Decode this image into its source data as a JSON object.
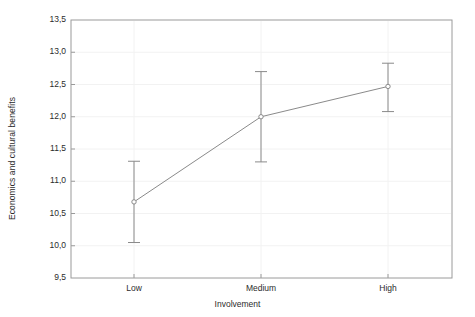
{
  "chart_data": {
    "type": "line",
    "title": "",
    "subtitle": "",
    "xlabel": "Involvement",
    "ylabel": "Economics and cultural benefits",
    "categories": [
      "Low",
      "Medium",
      "High"
    ],
    "values": [
      10.68,
      12.0,
      12.47
    ],
    "error_low": [
      10.05,
      11.3,
      12.08
    ],
    "error_high": [
      11.31,
      12.7,
      12.83
    ],
    "error_type": "95% CI",
    "ylim": [
      9.5,
      13.5
    ],
    "ytick_labels": [
      "13,5",
      "13,0",
      "12,5",
      "12,0",
      "11,5",
      "11,0",
      "10,5",
      "10,0",
      "9,5"
    ],
    "ytick_values": [
      13.5,
      13.0,
      12.5,
      12.0,
      11.5,
      11.0,
      10.5,
      10.0,
      9.5
    ],
    "xtick_labels": [
      "Low",
      "Medium",
      "High"
    ],
    "grid": true,
    "legend": "none",
    "decimal_separator": ",",
    "marker": "open-circle",
    "series": [
      {
        "name": "Mean",
        "values": [
          10.68,
          12.0,
          12.47
        ]
      }
    ],
    "colors": {
      "line": "#8a8a8a",
      "marker": "#8a8a8a",
      "error_bar": "#8a8a8a",
      "grid": "#f2f2f2",
      "frame": "#9a9a9a",
      "text": "#2b2b2b",
      "background": "#ffffff"
    }
  }
}
